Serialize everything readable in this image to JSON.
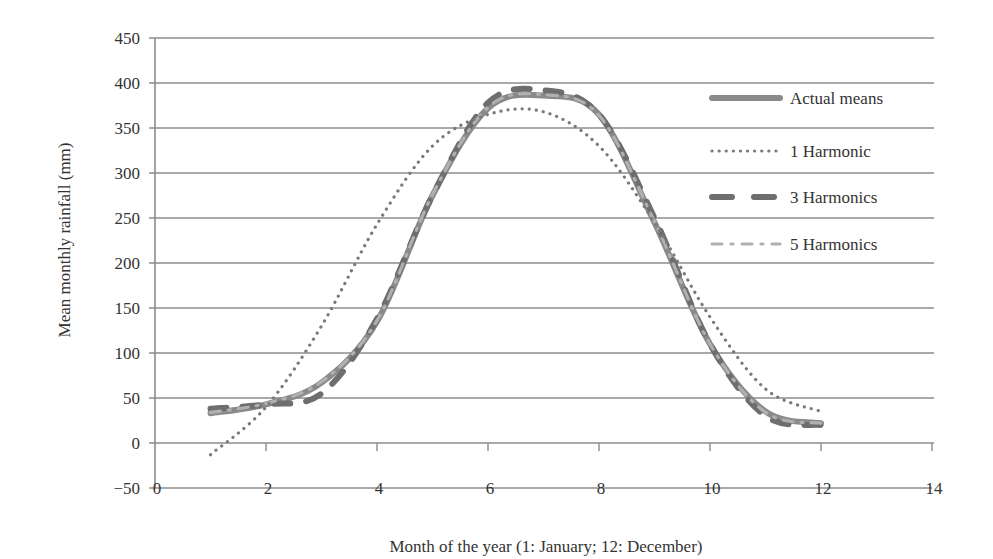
{
  "chart_data": {
    "type": "line",
    "title": "",
    "xlabel": "Month of the year (1: January; 12: December)",
    "ylabel": "Mean monthly rainfall (mm)",
    "xlim": [
      0,
      14
    ],
    "ylim": [
      -50,
      450
    ],
    "x_ticks": [
      0,
      2,
      4,
      6,
      8,
      10,
      12,
      14
    ],
    "y_ticks": [
      -50,
      0,
      50,
      100,
      150,
      200,
      250,
      300,
      350,
      400,
      450
    ],
    "grid": "horizontal",
    "legend_position": "right-inside",
    "x": [
      1,
      2,
      3,
      4,
      5,
      6,
      7,
      8,
      9,
      10,
      11,
      12
    ],
    "series": [
      {
        "name": "Actual means",
        "style": "solid-thick",
        "color": "#8a8a8a",
        "values": [
          33,
          43,
          67,
          135,
          275,
          372,
          386,
          365,
          245,
          110,
          35,
          22
        ]
      },
      {
        "name": "1 Harmonic",
        "style": "dotted",
        "color": "#7a7a7a",
        "values": [
          -13,
          40,
          130,
          243,
          330,
          365,
          368,
          330,
          245,
          140,
          60,
          35
        ]
      },
      {
        "name": "3 Harmonics",
        "style": "long-dash",
        "color": "#6e6e6e",
        "values": [
          38,
          43,
          55,
          138,
          275,
          378,
          392,
          365,
          250,
          110,
          30,
          20
        ]
      },
      {
        "name": "5 Harmonics",
        "style": "dash-dot",
        "color": "#b0b0b0",
        "values": [
          34,
          44,
          68,
          136,
          276,
          373,
          387,
          364,
          246,
          110,
          34,
          22
        ]
      }
    ]
  }
}
